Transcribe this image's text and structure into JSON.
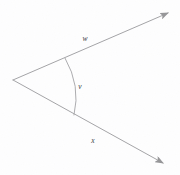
{
  "figure": {
    "type": "geometry-diagram",
    "background_color": "#fdfdfe",
    "stroke_color": "#4a4a50",
    "label_color": "#3a3a3e",
    "canvas": {
      "width": 180,
      "height": 175
    },
    "vertex": {
      "x": 13,
      "y": 80
    },
    "rays": [
      {
        "name": "upper-ray",
        "label": "w",
        "label_position": {
          "x": 85,
          "y": 39
        },
        "start": {
          "x": 13,
          "y": 80
        },
        "end": {
          "x": 170,
          "y": 12
        },
        "arrowhead": "end"
      },
      {
        "name": "lower-ray",
        "label": "x",
        "label_position": {
          "x": 93,
          "y": 141
        },
        "start": {
          "x": 13,
          "y": 80
        },
        "end": {
          "x": 165,
          "y": 165
        },
        "arrowhead": "end"
      }
    ],
    "angle_arc": {
      "label": "v",
      "label_position": {
        "x": 80,
        "y": 87
      },
      "start": {
        "x": 65,
        "y": 58
      },
      "end": {
        "x": 74,
        "y": 115
      },
      "bulge_x": 77,
      "path": "M 65 58 Q 81 86 74 115"
    }
  }
}
